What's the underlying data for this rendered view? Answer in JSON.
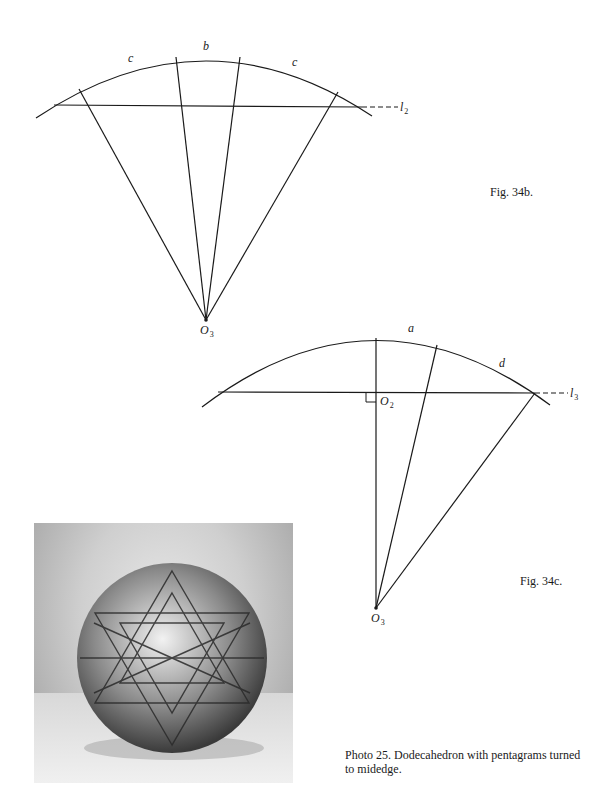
{
  "figures": [
    {
      "id": "fig-34b",
      "caption": "Fig. 34b.",
      "arc_labels": [
        "c",
        "b",
        "c"
      ],
      "line_label": {
        "main": "l",
        "sub": "2"
      },
      "center_label": {
        "main": "O",
        "sub": "3"
      }
    },
    {
      "id": "fig-34c",
      "caption": "Fig. 34c.",
      "arc_labels": [
        "a",
        "d"
      ],
      "line_label": {
        "main": "l",
        "sub": "3"
      },
      "foot_label": {
        "main": "O",
        "sub": "2"
      },
      "center_label": {
        "main": "O",
        "sub": "3"
      }
    }
  ],
  "photo": {
    "caption_line1": "Photo 25. Dodecahedron with pentagrams turned",
    "caption_line2": "to midedge."
  },
  "colors": {
    "ink": "#1a1a1a",
    "paper": "#ffffff"
  }
}
